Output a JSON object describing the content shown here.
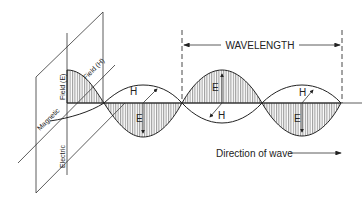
{
  "diagram": {
    "wavelength_label": "WAVELENGTH",
    "direction_label": "Direction of wave",
    "plane_labels": {
      "electric_field_part1": "Electric",
      "electric_field_part2": "Field (E)",
      "magnetic_field_part1": "Magnetic",
      "magnetic_field_part2": "Field (H)"
    },
    "wave_labels": {
      "h1": "H",
      "e1": "E",
      "e2": "E",
      "h2": "H",
      "h3": "H",
      "e3": "E"
    },
    "colors": {
      "line": "#222222",
      "hatch": "#555555",
      "background": "#ffffff"
    }
  }
}
